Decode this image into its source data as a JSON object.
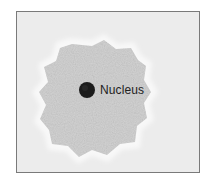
{
  "figure": {
    "label": "Nucleus",
    "colors": {
      "background": "#ececec",
      "border": "#7a7a7a",
      "halo": "#f7f7f7",
      "cytoplasm": "#d4d4d4",
      "nucleus": "#1c1c1c"
    }
  }
}
